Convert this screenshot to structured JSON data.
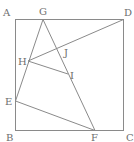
{
  "diagram": {
    "type": "geometry",
    "shape": "square ABCD with inscribed segments",
    "colors": {
      "line": "#8a8a8a",
      "label": "#6e6e6e",
      "background": "#ffffff"
    },
    "points": {
      "A": {
        "label": "A",
        "x": 15,
        "y": 19
      },
      "B": {
        "label": "B",
        "x": 15,
        "y": 130
      },
      "C": {
        "label": "C",
        "x": 123,
        "y": 130
      },
      "D": {
        "label": "D",
        "x": 123,
        "y": 19
      },
      "E": {
        "label": "E",
        "x": 15,
        "y": 101
      },
      "F": {
        "label": "F",
        "x": 95,
        "y": 130
      },
      "G": {
        "label": "G",
        "x": 43,
        "y": 19
      },
      "H": {
        "label": "H",
        "x": 28,
        "y": 61
      },
      "I": {
        "label": "I",
        "x": 68,
        "y": 74
      },
      "J": {
        "label": "J",
        "x": 62,
        "y": 48
      }
    },
    "segments": [
      [
        "A",
        "D"
      ],
      [
        "D",
        "C"
      ],
      [
        "C",
        "B"
      ],
      [
        "B",
        "A"
      ],
      [
        "G",
        "E"
      ],
      [
        "G",
        "F"
      ],
      [
        "H",
        "D"
      ],
      [
        "H",
        "I"
      ],
      [
        "E",
        "F"
      ]
    ],
    "labels": {
      "A": "A",
      "B": "B",
      "C": "C",
      "D": "D",
      "E": "E",
      "F": "F",
      "G": "G",
      "H": "H",
      "I": "I",
      "J": "J"
    }
  }
}
